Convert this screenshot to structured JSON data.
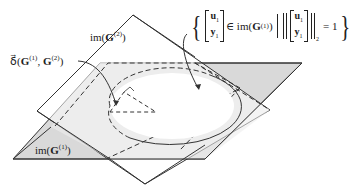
{
  "labels": {
    "image_g2": {
      "prefix": "im(",
      "symbol": "G",
      "sup": "(2)",
      "suffix": ")"
    },
    "image_g1": {
      "prefix": "im(",
      "symbol": "G",
      "sup": "(1)",
      "suffix": ")"
    },
    "gap_metric": {
      "prefix": "δ⃗(",
      "g1": "G",
      "g1_sup": "(1)",
      "sep": ", ",
      "g2": "G",
      "g2_sup": "(2)",
      "suffix": ")"
    }
  },
  "set_expression": {
    "open_brace": "{",
    "vector_top": "u",
    "vector_top_sub": "1",
    "vector_bottom": "y",
    "vector_bottom_sub": "1",
    "member": "∈ im(",
    "member_symbol": "G",
    "member_sup": "(1)",
    "member_close": ")",
    "norm_sub": "2",
    "equals": "= 1",
    "close_brace": "}"
  },
  "colors": {
    "plane_g1_fill": "#d9d9d9",
    "plane_g2_fill": "#ffffff",
    "overlap_fill": "#ededed",
    "stroke": "#333333"
  }
}
